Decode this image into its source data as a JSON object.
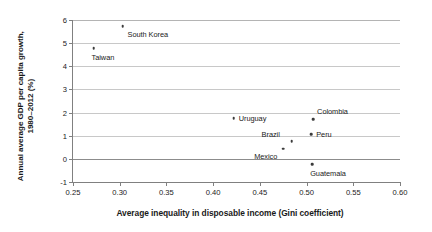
{
  "chart_data": {
    "type": "scatter",
    "title": "",
    "xlabel": "Average inequality in disposable income (Gini coefficient)",
    "ylabel_line1": "Annual average GDP per capita growth,",
    "ylabel_line2": "1980–2012 (%)",
    "xlim": [
      0.25,
      0.6
    ],
    "ylim": [
      -1,
      6
    ],
    "xticks": [
      "0.25",
      "0.30",
      "0.35",
      "0.40",
      "0.45",
      "0.50",
      "0.55",
      "0.60"
    ],
    "xtick_values": [
      0.25,
      0.3,
      0.35,
      0.4,
      0.45,
      0.5,
      0.55,
      0.6
    ],
    "yticks": [
      "-1",
      "0",
      "1",
      "2",
      "3",
      "4",
      "5",
      "6"
    ],
    "ytick_values": [
      -1,
      0,
      1,
      2,
      3,
      4,
      5,
      6
    ],
    "grid": true,
    "grid_axis": "y",
    "legend": null,
    "point_color": "#3b3b3b",
    "grid_color": "#c8c8c8",
    "points": [
      {
        "label": "South Korea",
        "x": 0.303,
        "y": 5.74,
        "label_pos": "right-below"
      },
      {
        "label": "Taiwan",
        "x": 0.272,
        "y": 4.79,
        "label_pos": "below"
      },
      {
        "label": "Uruguay",
        "x": 0.422,
        "y": 1.76,
        "label_pos": "right"
      },
      {
        "label": "Colombia",
        "x": 0.507,
        "y": 1.72,
        "label_pos": "right-above"
      },
      {
        "label": "Peru",
        "x": 0.505,
        "y": 1.07,
        "label_pos": "right"
      },
      {
        "label": "Brazil",
        "x": 0.484,
        "y": 0.77,
        "label_pos": "left-above"
      },
      {
        "label": "Mexico",
        "x": 0.475,
        "y": 0.43,
        "label_pos": "left-below"
      },
      {
        "label": "Guatemala",
        "x": 0.506,
        "y": -0.22,
        "label_pos": "below"
      }
    ]
  }
}
